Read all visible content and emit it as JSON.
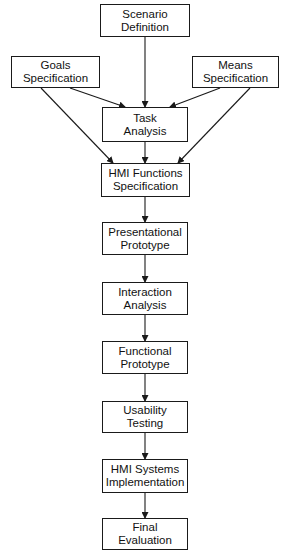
{
  "diagram": {
    "type": "flowchart",
    "nodes": [
      {
        "id": "scenario",
        "lines": [
          "Scenario",
          "Definition"
        ],
        "box": [
          100,
          4,
          90,
          33
        ]
      },
      {
        "id": "goals",
        "lines": [
          "Goals",
          "Specification"
        ],
        "box": [
          11,
          56,
          89,
          32
        ]
      },
      {
        "id": "means",
        "lines": [
          "Means",
          "Specification"
        ],
        "box": [
          192,
          56,
          87,
          32
        ]
      },
      {
        "id": "task",
        "lines": [
          "Task",
          "Analysis"
        ],
        "box": [
          102,
          107,
          86,
          35
        ]
      },
      {
        "id": "hmi_functions",
        "lines": [
          "HMI Functions",
          "Specification"
        ],
        "box": [
          101,
          163,
          89,
          34
        ]
      },
      {
        "id": "presentational",
        "lines": [
          "Presentational",
          "Prototype"
        ],
        "box": [
          102,
          222,
          86,
          33
        ]
      },
      {
        "id": "interaction",
        "lines": [
          "Interaction",
          "Analysis"
        ],
        "box": [
          102,
          282,
          86,
          33
        ]
      },
      {
        "id": "functional",
        "lines": [
          "Functional",
          "Prototype"
        ],
        "box": [
          102,
          341,
          86,
          33
        ]
      },
      {
        "id": "usability",
        "lines": [
          "Usability",
          "Testing"
        ],
        "box": [
          102,
          401,
          86,
          32
        ]
      },
      {
        "id": "hmi_systems",
        "lines": [
          "HMI Systems",
          "Implementation"
        ],
        "box": [
          102,
          459,
          86,
          34
        ]
      },
      {
        "id": "final",
        "lines": [
          "Final",
          "Evaluation"
        ],
        "box": [
          102,
          518,
          86,
          32
        ]
      }
    ],
    "edges": [
      {
        "from": "scenario",
        "to": "task",
        "points": [
          [
            145,
            37
          ],
          [
            145,
            107
          ]
        ]
      },
      {
        "from": "goals",
        "to": "task",
        "points": [
          [
            70,
            88
          ],
          [
            125,
            107
          ]
        ]
      },
      {
        "from": "means",
        "to": "task",
        "points": [
          [
            220,
            88
          ],
          [
            170,
            107
          ]
        ]
      },
      {
        "from": "goals",
        "to": "hmi_functions",
        "points": [
          [
            41,
            88
          ],
          [
            113,
            163
          ]
        ]
      },
      {
        "from": "means",
        "to": "hmi_functions",
        "points": [
          [
            250,
            88
          ],
          [
            178,
            163
          ]
        ]
      },
      {
        "from": "task",
        "to": "hmi_functions",
        "points": [
          [
            145,
            142
          ],
          [
            145,
            163
          ]
        ]
      },
      {
        "from": "hmi_functions",
        "to": "presentational",
        "points": [
          [
            145,
            197
          ],
          [
            145,
            222
          ]
        ]
      },
      {
        "from": "presentational",
        "to": "interaction",
        "points": [
          [
            145,
            255
          ],
          [
            145,
            282
          ]
        ]
      },
      {
        "from": "interaction",
        "to": "functional",
        "points": [
          [
            145,
            315
          ],
          [
            145,
            341
          ]
        ]
      },
      {
        "from": "functional",
        "to": "usability",
        "points": [
          [
            145,
            374
          ],
          [
            145,
            401
          ]
        ]
      },
      {
        "from": "usability",
        "to": "hmi_systems",
        "points": [
          [
            145,
            433
          ],
          [
            145,
            459
          ]
        ]
      },
      {
        "from": "hmi_systems",
        "to": "final",
        "points": [
          [
            145,
            493
          ],
          [
            145,
            518
          ]
        ]
      }
    ],
    "colors": {
      "stroke": "#1a1a1a",
      "fill": "#ffffff",
      "text": "#111111"
    }
  },
  "labels": {
    "scenario": {
      "line1": "Scenario",
      "line2": "Definition"
    },
    "goals": {
      "line1": "Goals",
      "line2": "Specification"
    },
    "means": {
      "line1": "Means",
      "line2": "Specification"
    },
    "task": {
      "line1": "Task",
      "line2": "Analysis"
    },
    "hmi_functions": {
      "line1": "HMI Functions",
      "line2": "Specification"
    },
    "presentational": {
      "line1": "Presentational",
      "line2": "Prototype"
    },
    "interaction": {
      "line1": "Interaction",
      "line2": "Analysis"
    },
    "functional": {
      "line1": "Functional",
      "line2": "Prototype"
    },
    "usability": {
      "line1": "Usability",
      "line2": "Testing"
    },
    "hmi_systems": {
      "line1": "HMI Systems",
      "line2": "Implementation"
    },
    "final": {
      "line1": "Final",
      "line2": "Evaluation"
    }
  }
}
